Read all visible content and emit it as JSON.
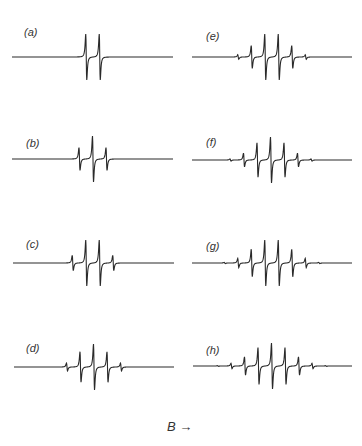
{
  "chart_data": {
    "type": "line",
    "title": "",
    "xlabel": "B →",
    "ylabel": "",
    "grid": false,
    "legend": "none",
    "panels": [
      {
        "label": "(a)",
        "n_equivalent_nuclei": 1,
        "lines": 2,
        "relative_intensities": [
          1,
          1
        ]
      },
      {
        "label": "(b)",
        "n_equivalent_nuclei": 2,
        "lines": 3,
        "relative_intensities": [
          1,
          2,
          1
        ]
      },
      {
        "label": "(c)",
        "n_equivalent_nuclei": 3,
        "lines": 4,
        "relative_intensities": [
          1,
          3,
          3,
          1
        ]
      },
      {
        "label": "(d)",
        "n_equivalent_nuclei": 4,
        "lines": 5,
        "relative_intensities": [
          1,
          4,
          6,
          4,
          1
        ]
      },
      {
        "label": "(e)",
        "n_equivalent_nuclei": 5,
        "lines": 6,
        "relative_intensities": [
          1,
          5,
          10,
          10,
          5,
          1
        ]
      },
      {
        "label": "(f)",
        "n_equivalent_nuclei": 6,
        "lines": 7,
        "relative_intensities": [
          1,
          6,
          15,
          20,
          15,
          6,
          1
        ]
      },
      {
        "label": "(g)",
        "n_equivalent_nuclei": 7,
        "lines": 8,
        "relative_intensities": [
          1,
          7,
          21,
          35,
          35,
          21,
          7,
          1
        ]
      },
      {
        "label": "(h)",
        "n_equivalent_nuclei": 8,
        "lines": 9,
        "relative_intensities": [
          1,
          8,
          28,
          56,
          70,
          56,
          28,
          8,
          1
        ]
      }
    ]
  },
  "figure": {
    "axis_label_symbol": "B",
    "axis_label_arrow": "→"
  }
}
